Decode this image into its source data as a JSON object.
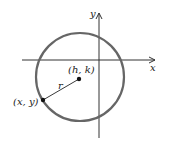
{
  "diagram": {
    "type": "circle-in-coordinate-plane",
    "axes": {
      "x_label": "x",
      "y_label": "y"
    },
    "center_label": "(h, k)",
    "point_label": "(x, y)",
    "radius_label": "r",
    "colors": {
      "circle": "#666666",
      "axes": "#333333",
      "points": "#111111"
    }
  }
}
